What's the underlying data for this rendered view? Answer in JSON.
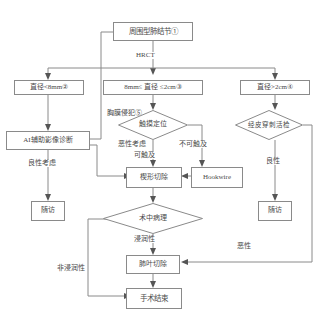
{
  "diagram": {
    "type": "clinical-decision-flowchart",
    "colors": {
      "stroke": "#8a8a8a",
      "text": "#4a4a4a",
      "background": "#ffffff",
      "arrow": "#555555"
    },
    "nodes": {
      "root": {
        "label": "周围型肺结节①",
        "shape": "rect"
      },
      "size_small": {
        "label": "直径<8mm②",
        "shape": "rect"
      },
      "size_mid": {
        "label": "8mm≤ 直径 ≤2cm③",
        "shape": "rect"
      },
      "size_large": {
        "label": "直径>2cm④",
        "shape": "rect"
      },
      "ai_diagnosis": {
        "label": "AI辅助影像诊断",
        "shape": "rect"
      },
      "palpation": {
        "label": "触摸定位",
        "shape": "diamond"
      },
      "biopsy": {
        "label": "经皮穿刺活检",
        "shape": "diamond"
      },
      "wedge_resection": {
        "label": "楔形切除",
        "shape": "rect"
      },
      "hookwire": {
        "label": "Hookwire",
        "shape": "rect"
      },
      "followup_left": {
        "label": "随访",
        "shape": "rect"
      },
      "followup_right": {
        "label": "随访",
        "shape": "rect"
      },
      "intraop_pathology": {
        "label": "术中病理",
        "shape": "diamond"
      },
      "lobectomy": {
        "label": "肺叶切除",
        "shape": "rect"
      },
      "surgery_end": {
        "label": "手术结束",
        "shape": "rect"
      }
    },
    "edge_labels": {
      "hrct": "HRCT",
      "pleural_invasion": "胸膜侵犯⑤",
      "malignant_suspect": "恶性考虑",
      "benign_suspect": "良性考虑",
      "palpable": "可触及",
      "not_palpable": "不可触及",
      "benign": "良性",
      "malignant": "恶性",
      "invasive": "浸润性",
      "non_invasive": "非浸润性"
    }
  }
}
